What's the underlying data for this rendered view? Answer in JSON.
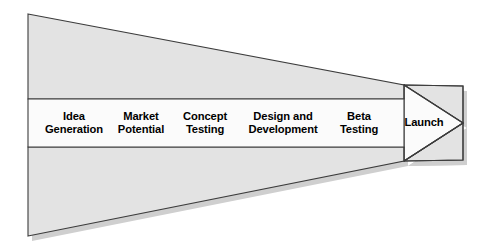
{
  "diagram": {
    "type": "funnel",
    "colors": {
      "funnel_fill": "#e3e3e3",
      "band_fill": "#fbfbfb",
      "arrow_fill": "#fbfbfb",
      "outline": "#3c3c3c",
      "shadow": "#cfcfcf",
      "label_text": "#000000",
      "page_background": "#ffffff"
    },
    "stages": [
      {
        "index": 1,
        "name": "idea-generation",
        "lines": [
          "Idea",
          "Generation"
        ],
        "center_x": 74,
        "center_y": 123
      },
      {
        "index": 2,
        "name": "market-potential",
        "lines": [
          "Market",
          "Potential"
        ],
        "center_x": 141,
        "center_y": 123
      },
      {
        "index": 3,
        "name": "concept-testing",
        "lines": [
          "Concept",
          "Testing"
        ],
        "center_x": 205,
        "center_y": 123
      },
      {
        "index": 4,
        "name": "design-and-development",
        "lines": [
          "Design and",
          "Development"
        ],
        "center_x": 283,
        "center_y": 123
      },
      {
        "index": 5,
        "name": "beta-testing",
        "lines": [
          "Beta",
          "Testing"
        ],
        "center_x": 359,
        "center_y": 123
      },
      {
        "index": 6,
        "name": "launch",
        "lines": [
          "Launch"
        ],
        "center_x": 424,
        "center_y": 123
      }
    ],
    "geometry": {
      "top_wedge_points": "28,14 404,85 404,99 28,99",
      "bottom_wedge_points": "28,236 404,161 404,147 28,147",
      "band_points": "28,99 404,99 404,147 28,147",
      "arrow_points": "404,85 463,86 463,160 404,161 463,123",
      "arrow_upper_points": "404,85 463,86 463,123",
      "arrow_lower_points": "404,161 463,160 463,123",
      "shadow_offset_x": 4,
      "shadow_offset_y": 5
    }
  }
}
